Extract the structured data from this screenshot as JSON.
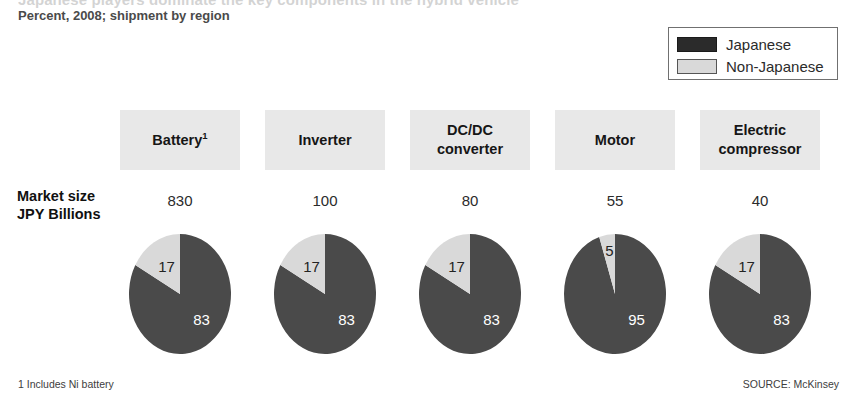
{
  "header": {
    "title": "Japanese players dominate the key components in the hybrid vehicle",
    "subtitle": "Percent, 2008; shipment by region"
  },
  "legend": {
    "items": [
      {
        "label": "Japanese",
        "color": "#2b2b2b",
        "key": "japanese"
      },
      {
        "label": "Non-Japanese",
        "color": "#d9d9d9",
        "key": "non_japanese"
      }
    ]
  },
  "row_labels": {
    "market_size_line1": "Market size",
    "market_size_line2": "JPY Billions"
  },
  "columns": [
    {
      "header": "Battery",
      "footnote_marker": "1",
      "header_line2": "",
      "market_size": "830"
    },
    {
      "header": "Inverter",
      "footnote_marker": "",
      "header_line2": "",
      "market_size": "100"
    },
    {
      "header": "DC/DC",
      "footnote_marker": "",
      "header_line2": "converter",
      "market_size": "80"
    },
    {
      "header": "Motor",
      "footnote_marker": "",
      "header_line2": "",
      "market_size": "55"
    },
    {
      "header": "Electric",
      "footnote_marker": "",
      "header_line2": "compressor",
      "market_size": "40"
    }
  ],
  "footnotes": {
    "note": "1 Includes Ni battery",
    "source": "SOURCE: McKinsey"
  },
  "chart_data": {
    "type": "pie",
    "title": "Japanese players dominate the key components in the hybrid vehicle",
    "subtitle": "Percent, 2008; shipment by region",
    "unit": "percent",
    "legend_position": "top-right",
    "series_names": [
      "Japanese",
      "Non-Japanese"
    ],
    "series_colors": [
      "#4a4a4a",
      "#d9d9d9"
    ],
    "categories": [
      "Battery",
      "Inverter",
      "DC/DC converter",
      "Motor",
      "Electric compressor"
    ],
    "market_size_label": "Market size JPY Billions",
    "market_size_values": [
      830,
      100,
      80,
      55,
      40
    ],
    "pies": [
      {
        "category": "Battery",
        "market_size": 830,
        "slices": [
          {
            "name": "Japanese",
            "value": 83,
            "label": "83"
          },
          {
            "name": "Non-Japanese",
            "value": 17,
            "label": "17"
          }
        ]
      },
      {
        "category": "Inverter",
        "market_size": 100,
        "slices": [
          {
            "name": "Japanese",
            "value": 83,
            "label": "83"
          },
          {
            "name": "Non-Japanese",
            "value": 17,
            "label": "17"
          }
        ]
      },
      {
        "category": "DC/DC converter",
        "market_size": 80,
        "slices": [
          {
            "name": "Japanese",
            "value": 83,
            "label": "83"
          },
          {
            "name": "Non-Japanese",
            "value": 17,
            "label": "17"
          }
        ]
      },
      {
        "category": "Motor",
        "market_size": 55,
        "slices": [
          {
            "name": "Japanese",
            "value": 95,
            "label": "95"
          },
          {
            "name": "Non-Japanese",
            "value": 5,
            "label": "5"
          }
        ]
      },
      {
        "category": "Electric compressor",
        "market_size": 40,
        "slices": [
          {
            "name": "Japanese",
            "value": 83,
            "label": "83"
          },
          {
            "name": "Non-Japanese",
            "value": 17,
            "label": "17"
          }
        ]
      }
    ]
  }
}
